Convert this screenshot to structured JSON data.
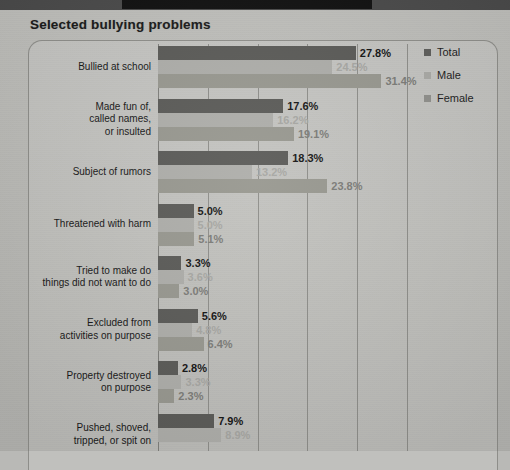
{
  "banner": {
    "label": ""
  },
  "title": "Selected bullying problems",
  "legend": {
    "items": [
      {
        "label": "Total",
        "color": "#5e5e5b"
      },
      {
        "label": "Male",
        "color": "#a9a9a5"
      },
      {
        "label": "Female",
        "color": "#8f8f8b"
      }
    ]
  },
  "colors": {
    "total": "#5a5a57",
    "male": "#adada9",
    "female": "#97978f",
    "gridline": "#8d8d89",
    "paper": "#bcbcb8",
    "text": "#171717"
  },
  "chart_data": {
    "type": "bar",
    "orientation": "horizontal",
    "title": "Selected bullying problems",
    "xlabel": "",
    "ylabel": "",
    "xlim": [
      0,
      35
    ],
    "gridlines": [
      0,
      7,
      14,
      21,
      28,
      35
    ],
    "grid": true,
    "legend_position": "right",
    "value_suffix": "%",
    "categories": [
      "Bullied at school",
      "Made fun of, called names, or insulted",
      "Subject of rumors",
      "Threatened with harm",
      "Tried to make do things did not want to do",
      "Excluded from activities on purpose",
      "Property destroyed on purpose",
      "Pushed, shoved, tripped, or spit on"
    ],
    "series": [
      {
        "name": "Total",
        "values": [
          27.8,
          17.6,
          18.3,
          5.0,
          3.3,
          5.6,
          2.8,
          7.9
        ]
      },
      {
        "name": "Male",
        "values": [
          24.5,
          16.2,
          13.2,
          5.0,
          3.6,
          4.8,
          3.3,
          8.9
        ]
      },
      {
        "name": "Female",
        "values": [
          31.4,
          19.1,
          23.8,
          5.1,
          3.0,
          6.4,
          2.3,
          null
        ]
      }
    ],
    "labels": {
      "Total": [
        "27.8%",
        "17.6%",
        "18.3%",
        "5.0%",
        "3.3%",
        "5.6%",
        "2.8%",
        "7.9%"
      ],
      "Male": [
        "24.5%",
        "16.2%",
        "13.2%",
        "5.0%",
        "3.6%",
        "4.8%",
        "3.3%",
        "8.9%"
      ],
      "Female": [
        "31.4%",
        "19.1%",
        "23.8%",
        "5.1%",
        "3.0%",
        "6.4%",
        "2.3%",
        ""
      ]
    },
    "note": "Last category 'Pushed, shoved, tripped, or spit on' is cut off at the bottom edge of the screenshot; its Female bar and value are not fully visible."
  },
  "category_lines": [
    [
      "Bullied at school"
    ],
    [
      "Made fun of,",
      "called names,",
      "or insulted"
    ],
    [
      "Subject of rumors"
    ],
    [
      "Threatened with harm"
    ],
    [
      "Tried to make do",
      "things did not want to do"
    ],
    [
      "Excluded from",
      "activities on purpose"
    ],
    [
      "Property destroyed",
      "on purpose"
    ],
    [
      "Pushed, shoved,",
      "tripped, or spit on"
    ]
  ]
}
